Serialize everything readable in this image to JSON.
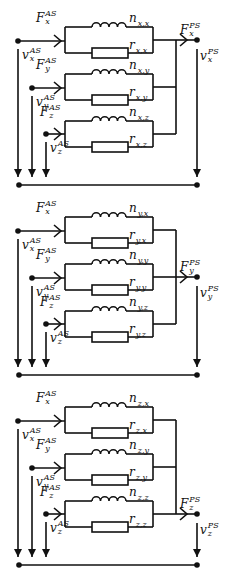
{
  "diagram": {
    "title": "",
    "colors": {
      "line": "#111111",
      "background": "#ffffff"
    },
    "blocks": [
      {
        "id": "x",
        "offset_y": 0,
        "output_branch": 0,
        "inputs": [
          {
            "force": "F",
            "force_sub": "x",
            "force_sup": "AS",
            "vel": "v",
            "vel_sub": "x",
            "vel_sup": "AS"
          },
          {
            "force": "F",
            "force_sub": "y",
            "force_sup": "AS",
            "vel": "v",
            "vel_sub": "y",
            "vel_sup": "AS"
          },
          {
            "force": "F",
            "force_sub": "z",
            "force_sup": "AS",
            "vel": "v",
            "vel_sub": "z",
            "vel_sup": "AS"
          }
        ],
        "branches": [
          {
            "inductor": "n",
            "inductor_sub": "x,x",
            "resistor": "r",
            "resistor_sub": "x,x"
          },
          {
            "inductor": "n",
            "inductor_sub": "x,y",
            "resistor": "r",
            "resistor_sub": "x,y"
          },
          {
            "inductor": "n",
            "inductor_sub": "x,z",
            "resistor": "r",
            "resistor_sub": "x,z"
          }
        ],
        "output": {
          "force": "F",
          "force_sub": "x",
          "force_sup": "PS",
          "vel": "v",
          "vel_sub": "x",
          "vel_sup": "PS"
        }
      },
      {
        "id": "y",
        "offset_y": 190,
        "output_branch": 1,
        "inputs": [
          {
            "force": "F",
            "force_sub": "x",
            "force_sup": "AS",
            "vel": "v",
            "vel_sub": "x",
            "vel_sup": "AS"
          },
          {
            "force": "F",
            "force_sub": "y",
            "force_sup": "AS",
            "vel": "v",
            "vel_sub": "y",
            "vel_sup": "AS"
          },
          {
            "force": "F",
            "force_sub": "z",
            "force_sup": "AS",
            "vel": "v",
            "vel_sub": "z",
            "vel_sup": "AS"
          }
        ],
        "branches": [
          {
            "inductor": "n",
            "inductor_sub": "y,x",
            "resistor": "r",
            "resistor_sub": "y,x"
          },
          {
            "inductor": "n",
            "inductor_sub": "y,y",
            "resistor": "r",
            "resistor_sub": "y,y"
          },
          {
            "inductor": "n",
            "inductor_sub": "y,z",
            "resistor": "r",
            "resistor_sub": "y,z"
          }
        ],
        "output": {
          "force": "F",
          "force_sub": "y",
          "force_sup": "PS",
          "vel": "v",
          "vel_sub": "y",
          "vel_sup": "PS"
        }
      },
      {
        "id": "z",
        "offset_y": 380,
        "output_branch": 2,
        "inputs": [
          {
            "force": "F",
            "force_sub": "x",
            "force_sup": "AS",
            "vel": "v",
            "vel_sub": "x",
            "vel_sup": "AS"
          },
          {
            "force": "F",
            "force_sub": "y",
            "force_sup": "AS",
            "vel": "v",
            "vel_sub": "y",
            "vel_sup": "AS"
          },
          {
            "force": "F",
            "force_sub": "z",
            "force_sup": "AS",
            "vel": "v",
            "vel_sub": "z",
            "vel_sup": "AS"
          }
        ],
        "branches": [
          {
            "inductor": "n",
            "inductor_sub": "z,x",
            "resistor": "r",
            "resistor_sub": "z,x"
          },
          {
            "inductor": "n",
            "inductor_sub": "z,y",
            "resistor": "r",
            "resistor_sub": "z,y"
          },
          {
            "inductor": "n",
            "inductor_sub": "z,z",
            "resistor": "r",
            "resistor_sub": "z,z"
          }
        ],
        "output": {
          "force": "F",
          "force_sub": "z",
          "force_sup": "PS",
          "vel": "v",
          "vel_sub": "z",
          "vel_sup": "PS"
        }
      }
    ]
  }
}
